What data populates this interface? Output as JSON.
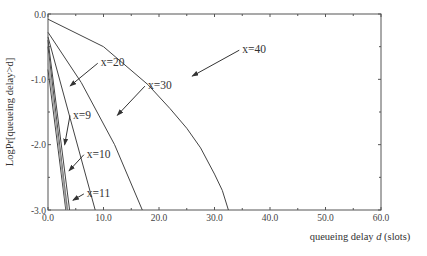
{
  "chart_data": {
    "type": "line",
    "title": "",
    "xlabel": "queueing delay d (slots)",
    "xlabel_parts": {
      "pre": "queueing delay ",
      "var": "d",
      "post": " (slots)"
    },
    "ylabel": "LogPr[queueing delay>d]",
    "xlim": [
      0,
      60
    ],
    "ylim": [
      -3.0,
      0.0
    ],
    "grid": false,
    "legend": "none (inline annotations with arrows)",
    "x_ticks": [
      "0.0",
      "10.0",
      "20.0",
      "30.0",
      "40.0",
      "50.0",
      "60.0"
    ],
    "y_ticks": [
      "0.0",
      "-1.0",
      "-2.0",
      "-3.0"
    ],
    "series": [
      {
        "name": "x=40",
        "points": [
          [
            0,
            -0.08
          ],
          [
            10,
            -0.5
          ],
          [
            18,
            -1.08
          ],
          [
            22,
            -1.45
          ],
          [
            25,
            -1.75
          ],
          [
            27.5,
            -2.05
          ],
          [
            30,
            -2.45
          ],
          [
            31.4,
            -2.7
          ],
          [
            32.5,
            -3.0
          ]
        ]
      },
      {
        "name": "x=30",
        "points": [
          [
            0,
            -0.28
          ],
          [
            6,
            -1.05
          ],
          [
            12,
            -2.0
          ],
          [
            17,
            -3.0
          ]
        ]
      },
      {
        "name": "x=20",
        "points": [
          [
            0,
            -0.35
          ],
          [
            4,
            -1.6
          ],
          [
            8.5,
            -3.0
          ]
        ]
      },
      {
        "name": "x=11",
        "points": [
          [
            0,
            -0.4
          ],
          [
            3.9,
            -3.0
          ]
        ]
      },
      {
        "name": "x=10",
        "points": [
          [
            0,
            -0.5
          ],
          [
            3.5,
            -3.0
          ]
        ]
      },
      {
        "name": "x=9",
        "points": [
          [
            0,
            -0.85
          ],
          [
            3.2,
            -3.0
          ]
        ]
      }
    ],
    "annotations": [
      {
        "text": "x=40",
        "label_at": [
          35.0,
          -0.6
        ],
        "arrow_to": [
          26.0,
          -0.95
        ]
      },
      {
        "text": "x=30",
        "label_at": [
          18.0,
          -1.15
        ],
        "arrow_to": [
          12.5,
          -1.55
        ]
      },
      {
        "text": "x=20",
        "label_at": [
          9.5,
          -0.8
        ],
        "arrow_to": [
          4.0,
          -1.1
        ]
      },
      {
        "text": "x=9",
        "label_at": [
          4.5,
          -1.6
        ],
        "arrow_to": [
          3.0,
          -2.0
        ]
      },
      {
        "text": "x=10",
        "label_at": [
          7.0,
          -2.2
        ],
        "arrow_to": [
          3.8,
          -2.4
        ]
      },
      {
        "text": "x=11",
        "label_at": [
          7.0,
          -2.8
        ],
        "arrow_to": [
          4.5,
          -2.85
        ]
      }
    ]
  }
}
